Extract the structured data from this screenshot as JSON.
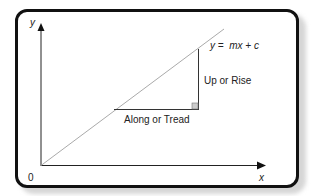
{
  "diagram": {
    "axes": {
      "x_label": "x",
      "y_label": "y",
      "origin_label": "0"
    },
    "equation": "y =  mx + c",
    "labels": {
      "rise": "Up or Rise",
      "run": "Along or Tread"
    },
    "colors": {
      "frame": "#111111",
      "axis": "#222222",
      "line": "#aaaaaa",
      "triangle": "#333333",
      "right_angle_fill": "#cccccc"
    }
  }
}
